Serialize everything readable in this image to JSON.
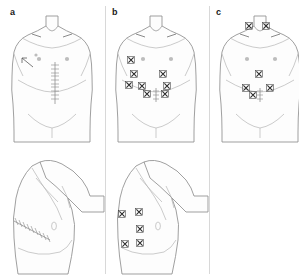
{
  "figure": {
    "type": "medical-illustration",
    "background_color": "#ffffff",
    "line_color": "#9a9a9a",
    "mark_color": "#2b2b2b",
    "width": 299,
    "height": 279
  },
  "panels": [
    {
      "id": "a",
      "label": "a",
      "label_x": 10,
      "label_y": 8,
      "views": [
        {
          "view_id": "a-anterior",
          "view_name": "anterior-torso",
          "marks": {
            "midline_suture": {
              "x": 55,
              "y_top": 62,
              "y_bottom": 104,
              "rungs": 12
            },
            "flank_drain": {
              "x": 31,
              "y": 63
            },
            "nipples": [
              {
                "x": 39,
                "y": 59
              },
              {
                "x": 71,
                "y": 59
              }
            ],
            "x_marks": []
          }
        },
        {
          "view_id": "a-lateral",
          "view_name": "lateral-torso-arm-raised",
          "marks": {
            "oblique_suture": {
              "x1": 14,
              "y1": 221,
              "x2": 50,
              "y2": 240,
              "rungs": 11
            },
            "x_marks": []
          }
        }
      ]
    },
    {
      "id": "b",
      "label": "b",
      "label_x": 112,
      "label_y": 8,
      "views": [
        {
          "view_id": "b-anterior",
          "view_name": "anterior-torso",
          "marks": {
            "midline_suture": {
              "x": 155,
              "y_top": 88,
              "y_bottom": 100,
              "rungs": 4
            },
            "nipples": [
              {
                "x": 140,
                "y": 59
              },
              {
                "x": 172,
                "y": 59
              }
            ],
            "x_marks": [
              {
                "x": 131,
                "y": 60
              },
              {
                "x": 134,
                "y": 74
              },
              {
                "x": 129,
                "y": 85
              },
              {
                "x": 142,
                "y": 86
              },
              {
                "x": 147,
                "y": 94
              },
              {
                "x": 163,
                "y": 74
              },
              {
                "x": 167,
                "y": 86
              },
              {
                "x": 165,
                "y": 94
              }
            ]
          }
        },
        {
          "view_id": "b-lateral",
          "view_name": "lateral-torso-arm-raised",
          "marks": {
            "x_marks": [
              {
                "x": 121,
                "y": 213
              },
              {
                "x": 138,
                "y": 212
              },
              {
                "x": 139,
                "y": 228
              },
              {
                "x": 125,
                "y": 243
              },
              {
                "x": 139,
                "y": 242
              }
            ]
          }
        }
      ]
    },
    {
      "id": "c",
      "label": "c",
      "label_x": 216,
      "label_y": 8,
      "views": [
        {
          "view_id": "c-anterior",
          "view_name": "anterior-torso",
          "marks": {
            "midline_suture": {
              "x": 259,
              "y_top": 88,
              "y_bottom": 100,
              "rungs": 4
            },
            "nipples": [
              {
                "x": 244,
                "y": 59
              },
              {
                "x": 276,
                "y": 59
              }
            ],
            "x_marks": [
              {
                "x": 249,
                "y": 26
              },
              {
                "x": 266,
                "y": 26
              },
              {
                "x": 259,
                "y": 74
              },
              {
                "x": 246,
                "y": 88
              },
              {
                "x": 270,
                "y": 88
              },
              {
                "x": 253,
                "y": 95
              }
            ]
          }
        }
      ]
    }
  ],
  "dividers": [
    {
      "x": 105,
      "y": 6,
      "height": 268
    },
    {
      "x": 209,
      "y": 6,
      "height": 268
    }
  ]
}
